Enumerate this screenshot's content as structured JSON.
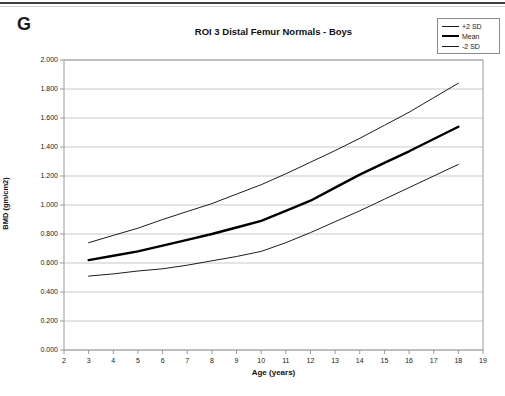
{
  "figure_label": "G",
  "chart_data": {
    "type": "line",
    "title": "ROI 3 Distal Femur Normals - Boys",
    "xlabel": "Age (years)",
    "ylabel": "BMD (gm/cm2)",
    "xlim": [
      2,
      19
    ],
    "ylim": [
      0,
      2
    ],
    "x_ticks": [
      "2",
      "3",
      "4",
      "5",
      "6",
      "7",
      "8",
      "9",
      "10",
      "11",
      "12",
      "13",
      "14",
      "15",
      "16",
      "17",
      "18",
      "19"
    ],
    "y_ticks": [
      "0.000",
      "0.200",
      "0.400",
      "0.600",
      "0.800",
      "1.000",
      "1.200",
      "1.400",
      "1.600",
      "1.800",
      "2.000"
    ],
    "grid": "horizontal",
    "legend_position": "top-right-outside",
    "x": [
      3,
      4,
      5,
      6,
      7,
      8,
      9,
      10,
      11,
      12,
      13,
      14,
      15,
      16,
      17,
      18
    ],
    "series": [
      {
        "name": "+2 SD",
        "style": "thin",
        "color": "#1c1c1c",
        "values": [
          0.74,
          0.79,
          0.84,
          0.9,
          0.955,
          1.01,
          1.075,
          1.14,
          1.215,
          1.295,
          1.375,
          1.46,
          1.55,
          1.64,
          1.74,
          1.84
        ]
      },
      {
        "name": "Mean",
        "style": "thick",
        "color": "#000000",
        "values": [
          0.62,
          0.65,
          0.68,
          0.72,
          0.76,
          0.8,
          0.845,
          0.89,
          0.96,
          1.03,
          1.12,
          1.21,
          1.29,
          1.37,
          1.455,
          1.54
        ]
      },
      {
        "name": "-2 SD",
        "style": "thin",
        "color": "#1c1c1c",
        "values": [
          0.51,
          0.525,
          0.545,
          0.56,
          0.585,
          0.615,
          0.645,
          0.68,
          0.74,
          0.81,
          0.885,
          0.96,
          1.04,
          1.12,
          1.2,
          1.28
        ]
      }
    ],
    "colors": {
      "gridline": "#c9c9c9",
      "axis_border": "#9a9a9a",
      "text": "#1a1a1a"
    }
  }
}
